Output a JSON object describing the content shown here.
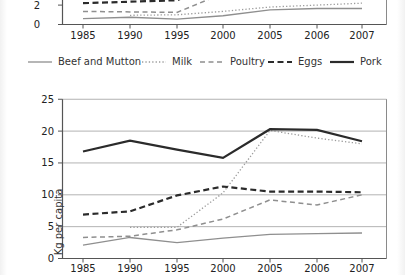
{
  "page_title": "Consumption line charts (kg per capita), top chart cropped",
  "colors": {
    "background": "#ffffff",
    "gray_line": "#8f8f8f",
    "dark_line": "#2b2b2b",
    "grid": "#a0a0a0",
    "axis": "#555555",
    "text": "#222222",
    "label_text": "#333333"
  },
  "styles": {
    "beef": {
      "color": "#8f8f8f",
      "dash": "",
      "width": 1.3
    },
    "milk": {
      "color": "#9c9c9c",
      "dash": "1.3 2.1",
      "width": 1.3
    },
    "poultry": {
      "color": "#8f8f8f",
      "dash": "5 3.5",
      "width": 1.5
    },
    "eggs": {
      "color": "#2b2b2b",
      "dash": "6 3.5",
      "width": 2.2
    },
    "pork": {
      "color": "#2b2b2b",
      "dash": "",
      "width": 2.2
    }
  },
  "legend": {
    "items": [
      {
        "key": "beef",
        "label": "Beef and Mutton",
        "x": 28
      },
      {
        "key": "milk",
        "label": "Milk",
        "x": 142
      },
      {
        "key": "poultry",
        "label": "Poultry",
        "x": 200
      },
      {
        "key": "eggs",
        "label": "Eggs",
        "x": 268
      },
      {
        "key": "pork",
        "label": "Pork",
        "x": 330
      }
    ]
  },
  "chart_data": [
    {
      "id": "top-chart",
      "type": "line",
      "title": "",
      "note": "chart cropped at top of screenshot; only values below ~2.5 visible",
      "categories": [
        "1985",
        "1990",
        "1995",
        "2000",
        "2005",
        "2006",
        "2007"
      ],
      "ylabel": "",
      "yticks": [
        0,
        2
      ],
      "ylim_visible": [
        0,
        2.5
      ],
      "grid_values": [],
      "series": [
        {
          "key": "beef",
          "name": "Beef and Mutton",
          "values": [
            0.6,
            0.75,
            0.55,
            0.9,
            1.5,
            1.65,
            1.65
          ]
        },
        {
          "key": "milk",
          "name": "Milk",
          "values": [
            null,
            0.95,
            1.0,
            1.35,
            1.8,
            2.0,
            2.2
          ]
        },
        {
          "key": "poultry",
          "name": "Poultry",
          "values": [
            1.35,
            1.3,
            1.25,
            3.2,
            null,
            null,
            null
          ]
        },
        {
          "key": "eggs",
          "name": "Eggs",
          "values": [
            2.2,
            2.35,
            2.5,
            4.5,
            null,
            null,
            null
          ]
        },
        {
          "key": "pork",
          "name": "Pork",
          "values": [
            null,
            null,
            null,
            null,
            null,
            null,
            null
          ]
        }
      ]
    },
    {
      "id": "bottom-chart",
      "type": "line",
      "title": "",
      "categories": [
        "1985",
        "1990",
        "1995",
        "2000",
        "2005",
        "2006",
        "2007"
      ],
      "xlabel": "",
      "ylabel": "Kg per capita",
      "yticks": [
        0,
        5,
        10,
        15,
        20,
        25
      ],
      "ylim": [
        0,
        25
      ],
      "grid": true,
      "grid_values": [
        5,
        10,
        15,
        20,
        25
      ],
      "legend_position": "above (shared)",
      "series": [
        {
          "key": "beef",
          "name": "Beef and Mutton",
          "values": [
            2.1,
            3.3,
            2.5,
            3.2,
            3.8,
            3.9,
            4.0
          ]
        },
        {
          "key": "milk",
          "name": "Milk",
          "values": [
            null,
            4.9,
            4.9,
            10.3,
            20.1,
            18.9,
            18.0
          ]
        },
        {
          "key": "poultry",
          "name": "Poultry",
          "values": [
            3.3,
            3.5,
            4.5,
            6.2,
            9.2,
            8.4,
            10.0
          ]
        },
        {
          "key": "eggs",
          "name": "Eggs",
          "values": [
            6.9,
            7.4,
            9.9,
            11.3,
            10.5,
            10.5,
            10.4
          ]
        },
        {
          "key": "pork",
          "name": "Pork",
          "values": [
            16.8,
            18.5,
            17.1,
            15.8,
            20.3,
            20.2,
            18.4
          ]
        }
      ]
    }
  ]
}
